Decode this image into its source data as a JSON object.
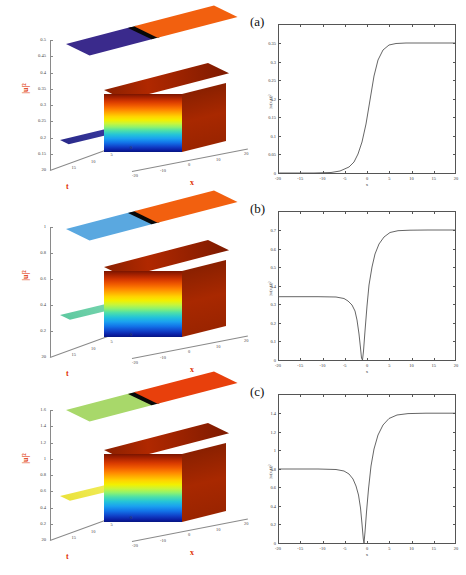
{
  "figure": {
    "panels": [
      {
        "letter": "(a)",
        "surface": {
          "zlabel": "|u|²",
          "xlabel": "x",
          "tlabel": "t",
          "z_ticks": [
            "0.5",
            "0.45",
            "0.4",
            "0.35",
            "0.3",
            "0.25",
            "0.2",
            "0.15"
          ],
          "z_bottom_tick": "20",
          "t_ticks": [
            "20",
            "15",
            "10",
            "5",
            "0"
          ],
          "x_ticks": [
            "-20",
            "-10",
            "0",
            "10",
            "20"
          ],
          "top_plane_left_color": "#3a2a8c",
          "top_plane_right_color": "#f2600f",
          "top_plane_band_color": "#080808",
          "colormap": "jet"
        },
        "line": {
          "ylabel": "|u(x,t)|²",
          "xlabel": "x",
          "y_ticks": [
            "0.35",
            "0.3",
            "0.25",
            "0.2",
            "0.15",
            "0.1",
            "0.05",
            "0"
          ],
          "x_ticks": [
            "-20",
            "-15",
            "-10",
            "-5",
            "0",
            "5",
            "10",
            "15",
            "20"
          ],
          "curve_color": "#555555"
        }
      },
      {
        "letter": "(b)",
        "surface": {
          "zlabel": "|u|²",
          "xlabel": "x",
          "tlabel": "t",
          "z_ticks": [
            "1",
            "0.8",
            "0.6",
            "0.4",
            "0.2"
          ],
          "z_bottom_tick": "20",
          "t_ticks": [
            "20",
            "15",
            "10",
            "5",
            "0"
          ],
          "x_ticks": [
            "-20",
            "-10",
            "0",
            "10",
            "20"
          ],
          "top_plane_left_color": "#5aa8e0",
          "top_plane_right_color": "#f2600f",
          "top_plane_band_color": "#080808",
          "colormap": "jet"
        },
        "line": {
          "ylabel": "|u(x,t)|²",
          "xlabel": "x",
          "y_ticks": [
            "0.7",
            "0.6",
            "0.5",
            "0.4",
            "0.3",
            "0.2",
            "0.1",
            "0"
          ],
          "x_ticks": [
            "-20",
            "-15",
            "-10",
            "-5",
            "0",
            "5",
            "10",
            "15",
            "20"
          ],
          "curve_color": "#555555"
        }
      },
      {
        "letter": "(c)",
        "surface": {
          "zlabel": "|u|²",
          "xlabel": "x",
          "tlabel": "t",
          "z_ticks": [
            "1.6",
            "1.4",
            "1.2",
            "1",
            "0.8",
            "0.6",
            "0.4",
            "0.2"
          ],
          "z_bottom_tick": "20",
          "t_ticks": [
            "20",
            "15",
            "10",
            "5",
            "0"
          ],
          "x_ticks": [
            "-20",
            "-10",
            "0",
            "10",
            "20"
          ],
          "top_plane_left_color": "#a8d86a",
          "top_plane_right_color": "#e8400c",
          "top_plane_band_color": "#080808",
          "colormap": "jet"
        },
        "line": {
          "ylabel": "|u(x,t)|²",
          "xlabel": "x",
          "y_ticks": [
            "1.4",
            "1.2",
            "1",
            "0.8",
            "0.6",
            "0.4",
            "0.2",
            "0"
          ],
          "x_ticks": [
            "-20",
            "-15",
            "-10",
            "-5",
            "0",
            "5",
            "10",
            "15",
            "20"
          ],
          "curve_color": "#555555"
        }
      }
    ]
  },
  "chart_data": [
    {
      "type": "line",
      "panel": "(a)",
      "title": "",
      "xlabel": "x",
      "ylabel": "|u(x,t)|²",
      "xlim": [
        -20,
        20
      ],
      "ylim": [
        0,
        0.35
      ],
      "grid": false,
      "legend": "none",
      "x": [
        -20,
        -18,
        -16,
        -14,
        -12,
        -10,
        -9,
        -8,
        -7,
        -6,
        -5,
        -4,
        -3,
        -2,
        -1,
        0,
        1,
        2,
        3,
        4,
        5,
        6,
        8,
        10,
        12,
        15,
        20
      ],
      "y": [
        0.0,
        0.0,
        0.0,
        0.0,
        0.001,
        0.002,
        0.003,
        0.005,
        0.009,
        0.016,
        0.029,
        0.052,
        0.089,
        0.142,
        0.205,
        0.258,
        0.289,
        0.3,
        0.302,
        0.303,
        0.303,
        0.303,
        0.303,
        0.303,
        0.303,
        0.303,
        0.303
      ],
      "description": "Kink profile rising monotonically from 0 to a plateau of about 0.3"
    },
    {
      "type": "line",
      "panel": "(b)",
      "title": "",
      "xlabel": "x",
      "ylabel": "|u(x,t)|²",
      "xlim": [
        -20,
        20
      ],
      "ylim": [
        0,
        0.7
      ],
      "grid": false,
      "legend": "none",
      "x": [
        -20,
        -17,
        -14,
        -12,
        -10,
        -9,
        -8,
        -7,
        -6,
        -5.5,
        -5,
        -4.5,
        -4,
        -3.5,
        -3.2,
        -3,
        -2.8,
        -2.5,
        -2,
        -1.5,
        -1,
        -0.5,
        0,
        0.5,
        1,
        1.5,
        2,
        3,
        4,
        6,
        8,
        12,
        16,
        20
      ],
      "y": [
        0.3,
        0.3,
        0.3,
        0.3,
        0.299,
        0.297,
        0.293,
        0.285,
        0.268,
        0.252,
        0.228,
        0.19,
        0.14,
        0.075,
        0.03,
        0.005,
        0.03,
        0.09,
        0.22,
        0.35,
        0.45,
        0.525,
        0.58,
        0.62,
        0.648,
        0.665,
        0.678,
        0.69,
        0.695,
        0.697,
        0.698,
        0.698,
        0.698,
        0.698
      ],
      "description": "Starts at plateau 0.3, dips sharply to 0 near x=-3, then rises to plateau of about 0.7"
    },
    {
      "type": "line",
      "panel": "(c)",
      "title": "",
      "xlabel": "x",
      "ylabel": "|u(x,t)|²",
      "xlim": [
        -20,
        20
      ],
      "ylim": [
        0,
        1.4
      ],
      "grid": false,
      "legend": "none",
      "x": [
        -20,
        -17,
        -14,
        -12,
        -10,
        -9,
        -8,
        -7,
        -6,
        -5,
        -4.5,
        -4,
        -3.5,
        -3,
        -2.6,
        -2.4,
        -2.2,
        -2,
        -1.8,
        -1.5,
        -1,
        -0.5,
        0,
        0.5,
        1,
        1.5,
        2,
        3,
        4,
        6,
        8,
        12,
        16,
        20
      ],
      "y": [
        0.7,
        0.7,
        0.7,
        0.7,
        0.699,
        0.697,
        0.692,
        0.682,
        0.66,
        0.615,
        0.58,
        0.53,
        0.45,
        0.33,
        0.17,
        0.08,
        0.02,
        0.005,
        0.06,
        0.22,
        0.5,
        0.7,
        0.85,
        0.955,
        1.02,
        1.06,
        1.08,
        1.098,
        1.102,
        1.103,
        1.103,
        1.103,
        1.103,
        1.103
      ],
      "description": "Starts at plateau 0.7, dips sharply to 0 near x=-2, then rises to plateau of about 1.1"
    }
  ]
}
